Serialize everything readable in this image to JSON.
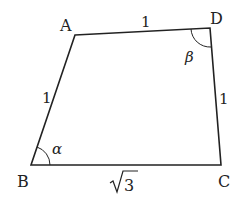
{
  "figure": {
    "type": "quadrilateral",
    "vertices": {
      "A": {
        "label": "A",
        "x": 75,
        "y": 35
      },
      "B": {
        "label": "B",
        "x": 31,
        "y": 165
      },
      "C": {
        "label": "C",
        "x": 221,
        "y": 165
      },
      "D": {
        "label": "D",
        "x": 210,
        "y": 28
      }
    },
    "sides": {
      "AD": "1",
      "AB": "1",
      "DC": "1",
      "BC": "3"
    },
    "angles": {
      "B": "α",
      "D": "β"
    },
    "colors": {
      "stroke": "#222222",
      "background": "#ffffff"
    }
  }
}
